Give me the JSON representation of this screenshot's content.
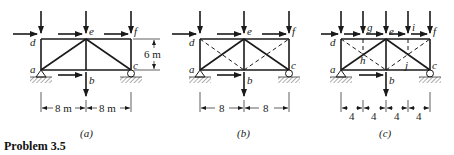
{
  "title": "Problem 3.5",
  "colors": {
    "ink": "#1a1a1a",
    "background": "#ffffff"
  },
  "trusses": [
    {
      "id": "a",
      "caption": "(a)",
      "nodes": {
        "d": "d",
        "e": "e",
        "f": "f",
        "a": "a",
        "b": "b",
        "c": "c"
      },
      "height_label": "6 m",
      "spans": [
        "8 m",
        "8 m"
      ],
      "diagonals": "solid from a to e and e to c"
    },
    {
      "id": "b",
      "caption": "(b)",
      "nodes": {
        "d": "d",
        "e": "e",
        "f": "f",
        "a": "a",
        "b": "b",
        "c": "c"
      },
      "spans": [
        "8",
        "8"
      ],
      "diagonals": "solid a-e, e-c; dashed d-b, b-f"
    },
    {
      "id": "c",
      "caption": "(c)",
      "nodes": {
        "d": "d",
        "g": "g",
        "e": "e",
        "i": "i",
        "f": "f",
        "h": "h",
        "j": "j",
        "a": "a",
        "b": "b",
        "c": "c"
      },
      "spans": [
        "4",
        "4",
        "4",
        "4"
      ],
      "diagonals": "solid a-e, e-c; dashed d-b, b-f; dashed verticals g-h, i-j"
    }
  ],
  "loads": {
    "vertical_at": [
      "d",
      "e",
      "f"
    ],
    "horizontal_at": [
      "d",
      "e",
      "f",
      "b"
    ],
    "downward_at": [
      "b"
    ]
  }
}
